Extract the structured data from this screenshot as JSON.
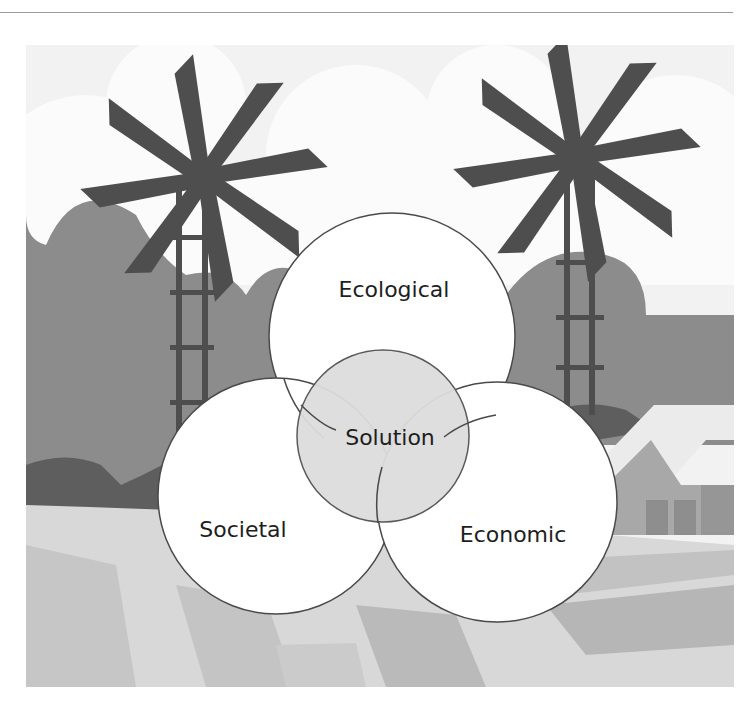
{
  "header": {
    "rule_visible": true
  },
  "figure": {
    "background_scene": "farm landscape with two windmills, trees, barn, and patchwork fields (grayscale)",
    "colors": {
      "sky": "#f4f4f4",
      "cloud": "#fafafa",
      "windmill": "#4e4e4e",
      "tree_mid": "#8a8a8a",
      "tree_dark": "#5c5c5c",
      "barn": "#a5a5a5",
      "field_light": "#d9d9d9",
      "field_mid": "#bdbdbd",
      "circle_fill": "#ffffff",
      "circle_stroke": "#4a4a4a",
      "center_fill": "#dedede"
    },
    "circles": [
      {
        "id": "ecological",
        "label": "Ecological"
      },
      {
        "id": "societal",
        "label": "Societal"
      },
      {
        "id": "economic",
        "label": "Economic"
      }
    ],
    "center": {
      "label": "Solution"
    }
  }
}
